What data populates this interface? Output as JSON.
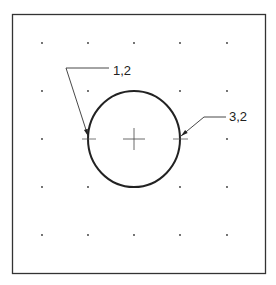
{
  "diagram": {
    "type": "cad-circle-two-point",
    "frame": {
      "x": 12,
      "y": 14,
      "width": 254,
      "height": 260,
      "stroke": "#333333"
    },
    "grid": {
      "xs": [
        42,
        88,
        134,
        180,
        227
      ],
      "ys": [
        43,
        91,
        139,
        187,
        235
      ],
      "dot_color": "#333333"
    },
    "circle": {
      "cx": 134,
      "cy": 139,
      "rx": 46,
      "ry": 48,
      "stroke": "#222222"
    },
    "center_mark": {
      "x": 134,
      "y": 139,
      "size": 11
    },
    "points": [
      {
        "label": "1,2",
        "x": 88,
        "y": 139
      },
      {
        "label": "3,2",
        "x": 180,
        "y": 139
      }
    ],
    "callouts": [
      {
        "text": "1,2",
        "text_x": 113,
        "text_y": 75,
        "elbow_x": 66,
        "elbow_y": 68,
        "line_end_x": 109,
        "tip_x": 88,
        "tip_y": 136
      },
      {
        "text": "3,2",
        "text_x": 229,
        "text_y": 121,
        "elbow_x": 204,
        "elbow_y": 117,
        "line_end_x": 226,
        "tip_x": 181,
        "tip_y": 136
      }
    ]
  }
}
